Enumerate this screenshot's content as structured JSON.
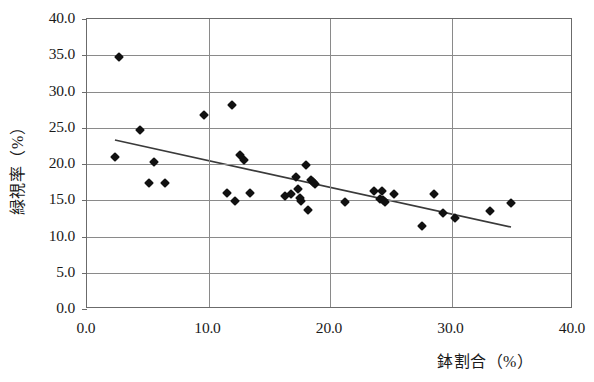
{
  "chart_data": {
    "type": "scatter",
    "title": "",
    "xlabel": "鉢割合（%）",
    "ylabel": "緑視率（%）",
    "xlim": [
      0.0,
      40.0
    ],
    "ylim": [
      0.0,
      40.0
    ],
    "xticks": [
      "0.0",
      "10.0",
      "20.0",
      "30.0",
      "40.0"
    ],
    "yticks": [
      "0.0",
      "5.0",
      "10.0",
      "15.0",
      "20.0",
      "25.0",
      "30.0",
      "35.0",
      "40.0"
    ],
    "xtick_values": [
      0,
      10,
      20,
      30,
      40
    ],
    "ytick_values": [
      0,
      5,
      10,
      15,
      20,
      25,
      30,
      35,
      40
    ],
    "grid": "both",
    "legend": "none",
    "marker": "diamond",
    "marker_color": "#111111",
    "grid_color": "#8a8a8a",
    "trendline": {
      "type": "linear",
      "color": "#3a3a3a",
      "x_start": 2.3,
      "y_start": 23.3,
      "x_end": 34.9,
      "y_end": 11.3
    },
    "points": [
      {
        "x": 2.6,
        "y": 34.7
      },
      {
        "x": 2.3,
        "y": 20.9
      },
      {
        "x": 4.4,
        "y": 24.7
      },
      {
        "x": 5.1,
        "y": 17.4
      },
      {
        "x": 5.5,
        "y": 20.3
      },
      {
        "x": 6.4,
        "y": 17.4
      },
      {
        "x": 9.6,
        "y": 26.7
      },
      {
        "x": 11.9,
        "y": 28.2
      },
      {
        "x": 11.5,
        "y": 16.0
      },
      {
        "x": 12.2,
        "y": 14.9
      },
      {
        "x": 12.6,
        "y": 21.2
      },
      {
        "x": 12.9,
        "y": 20.6
      },
      {
        "x": 13.4,
        "y": 16.0
      },
      {
        "x": 16.3,
        "y": 15.6
      },
      {
        "x": 16.8,
        "y": 15.9
      },
      {
        "x": 17.2,
        "y": 18.2
      },
      {
        "x": 17.4,
        "y": 16.6
      },
      {
        "x": 17.5,
        "y": 15.3
      },
      {
        "x": 17.6,
        "y": 14.9
      },
      {
        "x": 18.0,
        "y": 19.9
      },
      {
        "x": 18.2,
        "y": 13.6
      },
      {
        "x": 18.4,
        "y": 17.8
      },
      {
        "x": 18.6,
        "y": 17.5
      },
      {
        "x": 18.8,
        "y": 17.2
      },
      {
        "x": 21.2,
        "y": 14.8
      },
      {
        "x": 23.6,
        "y": 16.3
      },
      {
        "x": 24.3,
        "y": 16.3
      },
      {
        "x": 24.1,
        "y": 15.2
      },
      {
        "x": 24.4,
        "y": 15.0
      },
      {
        "x": 24.5,
        "y": 14.8
      },
      {
        "x": 25.3,
        "y": 15.8
      },
      {
        "x": 27.6,
        "y": 11.5
      },
      {
        "x": 28.6,
        "y": 15.8
      },
      {
        "x": 29.3,
        "y": 13.3
      },
      {
        "x": 30.3,
        "y": 12.6
      },
      {
        "x": 33.2,
        "y": 13.5
      },
      {
        "x": 34.9,
        "y": 14.6
      }
    ]
  }
}
